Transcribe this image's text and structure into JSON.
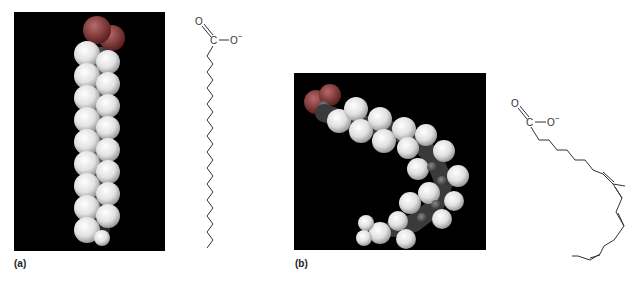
{
  "figure": {
    "panels": [
      {
        "id": "a",
        "label": "(a)",
        "model": "space-filling model, saturated fatty acid (straight chain)",
        "formula": {
          "carbonyl_O": "O",
          "carbon": "C",
          "anion_O": "O",
          "charge": "−"
        }
      },
      {
        "id": "b",
        "label": "(b)",
        "model": "space-filling model, unsaturated fatty acid (bent chain, cis double bonds)",
        "formula": {
          "carbonyl_O": "O",
          "carbon": "C",
          "anion_O": "O",
          "charge": "−"
        }
      }
    ],
    "colors": {
      "background": "#ffffff",
      "panel_bg": "#000000",
      "hydrogen": "#e8e8e8",
      "carbon": "#4a4a4a",
      "oxygen": "#7a2a2a",
      "bond_line": "#333333"
    }
  }
}
